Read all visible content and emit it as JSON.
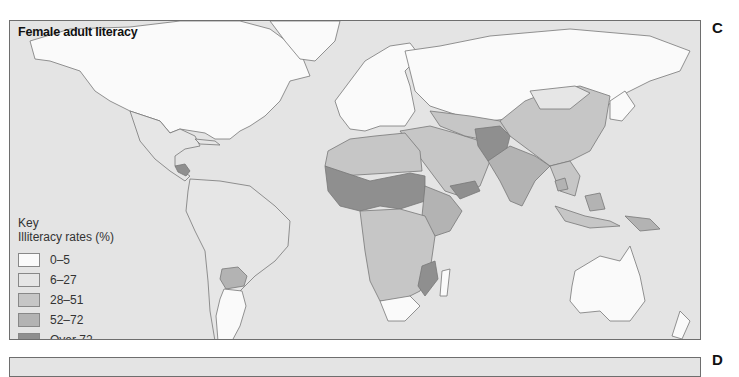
{
  "panels": {
    "c": {
      "letter": "C",
      "title": "Female adult literacy",
      "legend": {
        "heading": "Key",
        "subheading": "Illiteracy rates (%)",
        "items": [
          {
            "label": "0–5",
            "color": "#fafafa"
          },
          {
            "label": "6–27",
            "color": "#e6e6e6"
          },
          {
            "label": "28–51",
            "color": "#c6c6c6"
          },
          {
            "label": "52–72",
            "color": "#b3b3b3"
          },
          {
            "label": "Over 72",
            "color": "#8f8f8f"
          }
        ]
      }
    },
    "d": {
      "letter": "D"
    }
  },
  "colors": {
    "ocean": "#e4e4e4",
    "border": "#6e6e6e"
  }
}
